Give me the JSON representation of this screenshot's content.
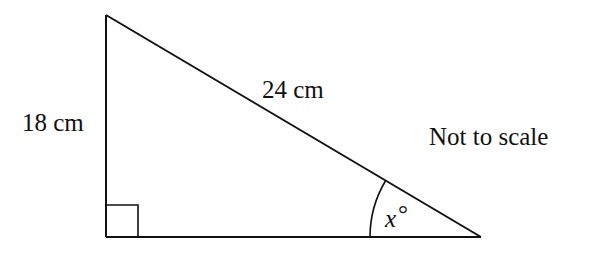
{
  "diagram": {
    "type": "right-triangle",
    "labels": {
      "vertical_side": "18 cm",
      "hypotenuse": "24 cm",
      "angle_var": "x",
      "angle_unit": "°",
      "note": "Not to scale"
    },
    "vertices": {
      "top": [
        106,
        15
      ],
      "right_angle": [
        106,
        237
      ],
      "right": [
        480,
        237
      ]
    },
    "right_angle_marker_size": 32,
    "angle_arc_radius": 110,
    "stroke_color": "#111111",
    "background": "#ffffff"
  }
}
